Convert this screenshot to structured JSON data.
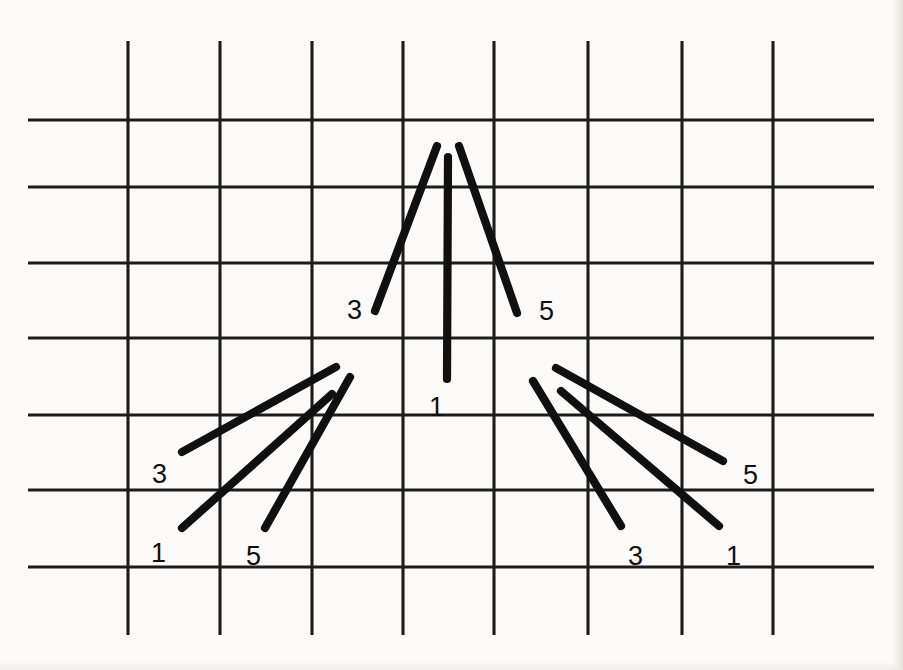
{
  "figure": {
    "kind": "scanned-line-segment-diagram",
    "background_color": "#fbfaf8",
    "ink_color": "#101010",
    "grid_color": "#1c1c1c",
    "width": 903,
    "height": 670
  },
  "chart_data": {
    "type": "scatter",
    "title": "",
    "subtitle": "",
    "xlabel": "",
    "ylabel": "",
    "grid": true,
    "legend_position": "none",
    "axis_ranges": {
      "x": [
        128,
        773
      ],
      "y": [
        120,
        567
      ]
    },
    "grid_lines": {
      "vertical_x": [
        128,
        220,
        312,
        403,
        494,
        588,
        682,
        773
      ],
      "vertical_y_extent": [
        41,
        635
      ],
      "horizontal_y": [
        120,
        187,
        263,
        338,
        415,
        490,
        567
      ],
      "horizontal_x_extent": [
        28,
        874
      ]
    },
    "annotations": [
      {
        "text": "3",
        "x": 347,
        "y": 297,
        "group": "center",
        "label_for": "center-segment-3"
      },
      {
        "text": "5",
        "x": 539,
        "y": 298,
        "group": "center",
        "label_for": "center-segment-5"
      },
      {
        "text": "1",
        "x": 429,
        "y": 394,
        "group": "center",
        "label_for": "center-segment-1"
      },
      {
        "text": "3",
        "x": 152,
        "y": 461,
        "group": "left",
        "label_for": "left-segment-3"
      },
      {
        "text": "1",
        "x": 151,
        "y": 540,
        "group": "left",
        "label_for": "left-segment-1"
      },
      {
        "text": "5",
        "x": 246,
        "y": 543,
        "group": "left",
        "label_for": "left-segment-5"
      },
      {
        "text": "5",
        "x": 743,
        "y": 462,
        "group": "right",
        "label_for": "right-segment-5"
      },
      {
        "text": "3",
        "x": 628,
        "y": 543,
        "group": "right",
        "label_for": "right-segment-3"
      },
      {
        "text": "1",
        "x": 726,
        "y": 543,
        "group": "right",
        "label_for": "right-segment-1"
      }
    ],
    "groups": [
      {
        "name": "center",
        "label": "center-fan",
        "apex": {
          "x": 448,
          "y": 150
        },
        "segments": [
          {
            "label": "3",
            "x1": 437,
            "y1": 146,
            "x2": 375,
            "y2": 311
          },
          {
            "label": "1",
            "x1": 448,
            "y1": 157,
            "x2": 447,
            "y2": 379
          },
          {
            "label": "5",
            "x1": 459,
            "y1": 146,
            "x2": 517,
            "y2": 313
          }
        ]
      },
      {
        "name": "left",
        "label": "left-fan",
        "apex": {
          "x": 340,
          "y": 372
        },
        "segments": [
          {
            "label": "3",
            "x1": 182,
            "y1": 452,
            "x2": 336,
            "y2": 367
          },
          {
            "label": "1",
            "x1": 182,
            "y1": 528,
            "x2": 332,
            "y2": 394
          },
          {
            "label": "5",
            "x1": 265,
            "y1": 528,
            "x2": 350,
            "y2": 377
          }
        ]
      },
      {
        "name": "right",
        "label": "right-fan",
        "apex": {
          "x": 556,
          "y": 378
        },
        "segments": [
          {
            "label": "5",
            "x1": 556,
            "y1": 368,
            "x2": 723,
            "y2": 461
          },
          {
            "label": "1",
            "x1": 561,
            "y1": 391,
            "x2": 719,
            "y2": 526
          },
          {
            "label": "3",
            "x1": 533,
            "y1": 381,
            "x2": 621,
            "y2": 526
          }
        ]
      }
    ]
  }
}
